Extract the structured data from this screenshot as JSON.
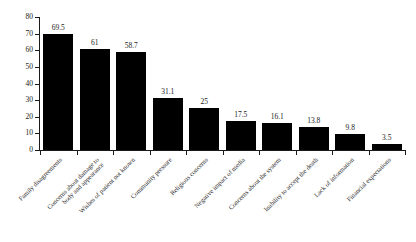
{
  "chart_data": {
    "type": "bar",
    "title": "",
    "subtitle": "",
    "xlabel": "",
    "ylabel": "",
    "ylim": [
      0,
      80
    ],
    "ytick_step": 10,
    "yticks": [
      0,
      10,
      20,
      30,
      40,
      50,
      60,
      70,
      80
    ],
    "grid": false,
    "legend": false,
    "bar_color": "#000000",
    "axis_color": "#1a1a1a",
    "value_labels_shown": true,
    "categories": [
      "Family disagreements",
      "Concerns about damage to body and appearance",
      "Wishes of patient not known",
      "Community pressure",
      "Religious concerns",
      "Negative impact of media",
      "Concerns about the system",
      "Inability to accept the death",
      "Lack of information",
      "Financial expectations"
    ],
    "category_lines": [
      [
        "Family disagreements"
      ],
      [
        "Concerns about damage to",
        "body and appearance"
      ],
      [
        "Wishes of patient not known"
      ],
      [
        "Community pressure"
      ],
      [
        "Religious concerns"
      ],
      [
        "Negative impact of media"
      ],
      [
        "Concerns about the system"
      ],
      [
        "Inability to accept the death"
      ],
      [
        "Lack of information"
      ],
      [
        "Financial expectations"
      ]
    ],
    "values": [
      69.5,
      61,
      58.7,
      31.1,
      25,
      17.5,
      16.1,
      13.8,
      9.8,
      3.5
    ],
    "value_label_text": [
      "69.5",
      "61",
      "58.7",
      "31.1",
      "25",
      "17.5",
      "16.1",
      "13.8",
      "9.8",
      "3.5"
    ]
  }
}
